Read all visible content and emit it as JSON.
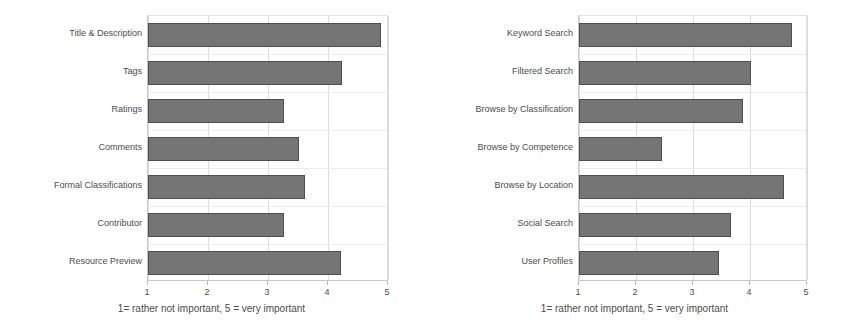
{
  "figure": {
    "background_color": "#ffffff",
    "bar_fill_color": "#757575",
    "bar_border_color": "#4f4f4f",
    "grid_color": "#dddddd",
    "text_color": "#4c4c4c"
  },
  "chart_data": [
    {
      "id": "left",
      "type": "bar",
      "orientation": "horizontal",
      "title": "",
      "subtitle": "",
      "xlabel": "1= rather not important, 5 = very important",
      "ylabel": "",
      "xlim": [
        1,
        5
      ],
      "xticks": [
        "1",
        "2",
        "3",
        "4",
        "5"
      ],
      "grid": true,
      "legend": "none",
      "categories": [
        "Title & Description",
        "Tags",
        "Ratings",
        "Comments",
        "Formal Classifications",
        "Contributor",
        "Resource Preview"
      ],
      "values": [
        4.88,
        4.24,
        3.26,
        3.52,
        3.61,
        3.27,
        4.22
      ]
    },
    {
      "id": "right",
      "type": "bar",
      "orientation": "horizontal",
      "title": "",
      "subtitle": "",
      "xlabel": "1= rather not important, 5 = very important",
      "ylabel": "",
      "xlim": [
        1,
        5
      ],
      "xticks": [
        "1",
        "2",
        "3",
        "4",
        "5"
      ],
      "grid": true,
      "legend": "none",
      "categories": [
        "Keyword Search",
        "Filtered Search",
        "Browse by Classification",
        "Browse by Competence",
        "Browse by Location",
        "Social Search",
        "User Profiles"
      ],
      "values": [
        4.74,
        4.02,
        3.88,
        2.46,
        4.6,
        3.67,
        3.45
      ]
    }
  ]
}
